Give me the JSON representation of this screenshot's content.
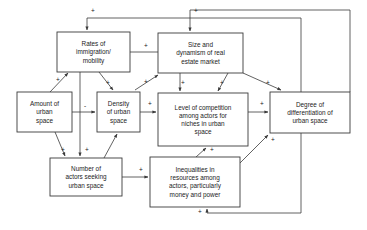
{
  "diagram": {
    "type": "causal-loop-diagram",
    "nodes": [
      {
        "id": "rates",
        "name": "rates-of-immigration-mobility",
        "lines": [
          "Rates of",
          "immigration/",
          "mobility"
        ],
        "x": 57,
        "y": 32,
        "w": 73,
        "h": 40
      },
      {
        "id": "market",
        "name": "size-and-dynamism-of-real-estate-market",
        "lines": [
          "Size and",
          "dynamism of real",
          "estate market"
        ],
        "x": 158,
        "y": 33,
        "w": 85,
        "h": 40
      },
      {
        "id": "amount",
        "name": "amount-of-urban-space",
        "lines": [
          "Amount of",
          "urban",
          "space"
        ],
        "x": 17,
        "y": 92,
        "w": 55,
        "h": 40
      },
      {
        "id": "density",
        "name": "density-of-urban-space",
        "lines": [
          "Density",
          "of urban",
          "space"
        ],
        "x": 97,
        "y": 92,
        "w": 43,
        "h": 40
      },
      {
        "id": "competition",
        "name": "level-of-competition-among-actors",
        "lines": [
          "Level of competition",
          "among actors for",
          "niches in urban",
          "space"
        ],
        "x": 158,
        "y": 93,
        "w": 90,
        "h": 53
      },
      {
        "id": "degree",
        "name": "degree-of-differentiation-of-urban-space",
        "lines": [
          "Degree of",
          "differentiation of",
          "urban space"
        ],
        "x": 270,
        "y": 92,
        "w": 80,
        "h": 41
      },
      {
        "id": "actors",
        "name": "number-of-actors-seeking-urban-space",
        "lines": [
          "Number of",
          "actors seeking",
          "urban space"
        ],
        "x": 50,
        "y": 158,
        "w": 72,
        "h": 38
      },
      {
        "id": "inequalities",
        "name": "inequalities-in-resources-among-actors",
        "lines": [
          "Inequalities in",
          "resources among",
          "actors, particularly",
          "money and power"
        ],
        "x": 150,
        "y": 157,
        "w": 90,
        "h": 50
      }
    ],
    "links": [
      {
        "from": "rates",
        "to": "market",
        "sign": "+",
        "sign_x": 146,
        "sign_y": 48,
        "path": "M130,52 L168,52",
        "name": "link-rates-to-market"
      },
      {
        "from": "amount",
        "to": "rates",
        "sign": "+",
        "sign_x": 58,
        "sign_y": 82,
        "path": "M50,92 L68,73",
        "name": "link-amount-to-rates"
      },
      {
        "from": "amount",
        "to": "density",
        "sign": "-",
        "sign_x": 85,
        "sign_y": 108,
        "path": "M72,112 L95,112",
        "name": "link-amount-to-density"
      },
      {
        "from": "amount",
        "to": "actors",
        "sign": "+",
        "sign_x": 63,
        "sign_y": 152,
        "path": "M55,132 L65,156",
        "name": "link-amount-to-actors"
      },
      {
        "from": "rates",
        "to": "density",
        "sign": "+",
        "sign_x": 108,
        "sign_y": 85,
        "path": "M99,72 L113,90",
        "name": "link-rates-to-density"
      },
      {
        "from": "rates",
        "to": "actors",
        "sign": "+",
        "sign_x": 87,
        "sign_y": 152,
        "path": "M80,72 L80,156",
        "name": "link-rates-to-actors"
      },
      {
        "from": "actors",
        "to": "density",
        "sign": "",
        "sign_x": 0,
        "sign_y": 0,
        "path": "M104,158 L117,134",
        "name": "link-actors-to-density"
      },
      {
        "from": "density",
        "to": "market",
        "sign": "+",
        "sign_x": 146,
        "sign_y": 84,
        "path": "M135,90 L158,75",
        "name": "link-density-to-market"
      },
      {
        "from": "density",
        "to": "competition",
        "sign": "+",
        "sign_x": 150,
        "sign_y": 106,
        "path": "M140,112 L156,112",
        "name": "link-density-to-competition"
      },
      {
        "from": "market",
        "to": "competition-left",
        "sign": "+",
        "sign_x": 183,
        "sign_y": 85,
        "path": "M180,73 L180,91",
        "name": "link-market-to-competition-left"
      },
      {
        "from": "market",
        "to": "competition-right",
        "sign": "+",
        "sign_x": 222,
        "sign_y": 85,
        "path": "M228,73 L218,91",
        "name": "link-market-to-competition-right"
      },
      {
        "from": "market",
        "to": "degree",
        "sign": "+",
        "sign_x": 268,
        "sign_y": 85,
        "path": "M243,73 L281,90",
        "name": "link-market-to-degree"
      },
      {
        "from": "competition",
        "to": "degree",
        "sign": "+",
        "sign_x": 262,
        "sign_y": 106,
        "path": "M248,112 L268,112",
        "name": "link-competition-to-degree"
      },
      {
        "from": "actors",
        "to": "inequalities",
        "sign": "+",
        "sign_x": 141,
        "sign_y": 172,
        "path": "M122,177 L148,177",
        "name": "link-actors-to-inequalities"
      },
      {
        "from": "inequalities",
        "to": "competition",
        "sign": "+",
        "sign_x": 212,
        "sign_y": 152,
        "path": "M196,157 L206,148",
        "name": "link-inequalities-to-competition"
      },
      {
        "from": "inequalities",
        "to": "degree",
        "sign": "+",
        "sign_x": 273,
        "sign_y": 142,
        "path": "M240,163 L268,135",
        "name": "link-inequalities-to-degree"
      },
      {
        "from": "degree",
        "to": "rates",
        "sign": "+",
        "sign_x": 93,
        "sign_y": 13,
        "path": "M301,92 L301,18 L87,18 L87,30",
        "name": "link-degree-to-rates"
      },
      {
        "from": "degree",
        "to": "market",
        "sign": "+",
        "sign_x": 196,
        "sign_y": 13,
        "path": "M350,92 L350,10 L190,10 L190,31",
        "name": "link-degree-to-market"
      },
      {
        "from": "degree",
        "to": "inequalities",
        "sign": "+",
        "sign_x": 200,
        "sign_y": 214,
        "path": "M301,133 L301,213 L207,213 L207,209",
        "name": "link-degree-to-inequalities"
      }
    ]
  }
}
